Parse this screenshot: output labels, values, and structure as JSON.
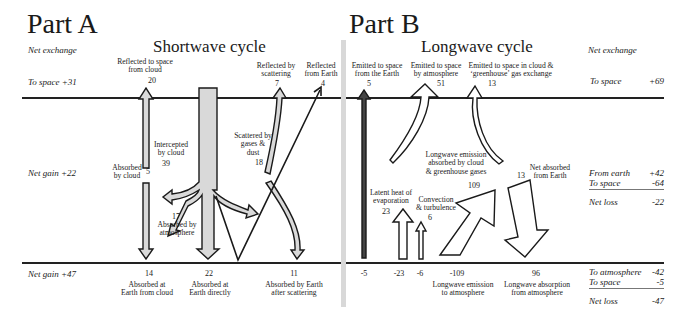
{
  "partA": {
    "title": "Part A",
    "cycle_title": "Shortwave cycle",
    "net_exchange_label": "Net exchange",
    "to_space": "To space +31",
    "net_gain_atmosphere": "Net gain +22",
    "net_gain_surface": "Net gain +47",
    "flows": {
      "reflected_cloud": {
        "label_1": "Reflected to space",
        "label_2": "from cloud",
        "value": "20"
      },
      "reflected_scattering": {
        "label_1": "Reflected by",
        "label_2": "scattering",
        "value": "7"
      },
      "reflected_earth": {
        "label_1": "Reflected",
        "label_2": "from Earth",
        "value": "4"
      },
      "intercepted_cloud": {
        "label_1": "Intercepted",
        "label_2": "by cloud",
        "value": "39"
      },
      "absorbed_cloud": {
        "label_1": "Absorbed",
        "label_2": "by cloud",
        "value": "5"
      },
      "scattered": {
        "label_1": "Scattered by",
        "label_2": "gases &",
        "label_3": "dust",
        "value": "18"
      },
      "absorbed_atmosphere": {
        "label_1": "Absorbed by",
        "label_2": "atmosphere",
        "value": "17"
      },
      "absorbed_earth_cloud": {
        "label_1": "Absorbed at",
        "label_2": "Earth from cloud",
        "value": "14"
      },
      "absorbed_earth_direct": {
        "label_1": "Absorbed at",
        "label_2": "Earth directly",
        "value": "22"
      },
      "absorbed_earth_scatter": {
        "label_1": "Absorbed by Earth",
        "label_2": "after scattering",
        "value": "11"
      }
    }
  },
  "partB": {
    "title": "Part B",
    "cycle_title": "Longwave cycle",
    "net_exchange_label": "Net exchange",
    "to_space": {
      "label": "To space",
      "value": "+69"
    },
    "atmosphere_balance": {
      "from_earth": {
        "label": "From earth",
        "value": "+42"
      },
      "to_space": {
        "label": "To space",
        "value": "-64"
      },
      "net_loss": {
        "label": "Net loss",
        "value": "-22"
      }
    },
    "surface_balance": {
      "to_atmosphere": {
        "label": "To atmosphere",
        "value": "-42"
      },
      "to_space": {
        "label": "To space",
        "value": "-5"
      },
      "net_loss": {
        "label": "Net loss",
        "value": "-47"
      }
    },
    "flows": {
      "emitted_earth": {
        "label_1": "Emitted to space",
        "label_2": "from the Earth",
        "value": "5"
      },
      "emitted_atmosphere": {
        "label_1": "Emitted to space",
        "label_2": "by atmosphere",
        "value": "51"
      },
      "emitted_cloud_gh": {
        "label_1": "Emitted to space in cloud &",
        "label_2": "‘greenhouse’ gas exchange",
        "value": "13"
      },
      "lw_absorbed": {
        "label_1": "Longwave emission",
        "label_2": "absorbed by cloud",
        "label_3": "& greenhouse gases",
        "value": "109"
      },
      "net_absorbed": {
        "label_1": "Net absorbed",
        "label_2": "from Earth",
        "value": "13"
      },
      "latent_heat": {
        "label_1": "Latent heat of",
        "label_2": "evaporation",
        "value": "23"
      },
      "convection": {
        "label_1": "Convection",
        "label_2": "& turbulence",
        "value": "6"
      }
    },
    "surface_values": {
      "v1": "-5",
      "v2": "-23",
      "v3": "-6",
      "v4": "-109",
      "v5": "96"
    },
    "surface_labels": {
      "lw_emission_1": "Longwave emission",
      "lw_emission_2": "to atmosphere",
      "lw_absorption_1": "Longwave absorption",
      "lw_absorption_2": "from atmosphere"
    }
  }
}
